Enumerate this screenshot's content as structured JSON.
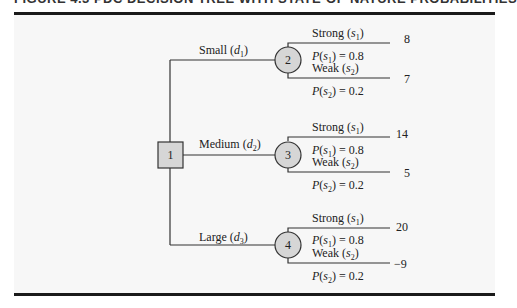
{
  "figure": {
    "caption": "FIGURE 4.3   PDC DECISION TREE WITH STATE-OF-NATURE PROBABILITIES"
  },
  "tree": {
    "decision_node": {
      "label": "1",
      "shape": "square"
    },
    "branches": [
      {
        "decision": "Small",
        "decision_symbol": "d",
        "decision_sub": "1",
        "chance_node": "2",
        "outcomes": [
          {
            "state": "Strong",
            "state_symbol": "s",
            "state_sub": "1",
            "prob_label": "P(s1) = 0.8",
            "prob_value": "0.8",
            "payoff": "8"
          },
          {
            "state": "Weak",
            "state_symbol": "s",
            "state_sub": "2",
            "prob_label": "P(s2) = 0.2",
            "prob_value": "0.2",
            "payoff": "7"
          }
        ]
      },
      {
        "decision": "Medium",
        "decision_symbol": "d",
        "decision_sub": "2",
        "chance_node": "3",
        "outcomes": [
          {
            "state": "Strong",
            "state_symbol": "s",
            "state_sub": "1",
            "prob_label": "P(s1) = 0.8",
            "prob_value": "0.8",
            "payoff": "14"
          },
          {
            "state": "Weak",
            "state_symbol": "s",
            "state_sub": "2",
            "prob_label": "P(s2) = 0.2",
            "prob_value": "0.2",
            "payoff": "5"
          }
        ]
      },
      {
        "decision": "Large",
        "decision_symbol": "d",
        "decision_sub": "3",
        "chance_node": "4",
        "outcomes": [
          {
            "state": "Strong",
            "state_symbol": "s",
            "state_sub": "1",
            "prob_label": "P(s1) = 0.8",
            "prob_value": "0.8",
            "payoff": "20"
          },
          {
            "state": "Weak",
            "state_symbol": "s",
            "state_sub": "2",
            "prob_label": "P(s2) = 0.2",
            "prob_value": "0.2",
            "payoff": "−9"
          }
        ]
      }
    ]
  },
  "colors": {
    "node_fill": "#d6d6d6",
    "line": "#333333",
    "rule": "#1a1a1a",
    "panel": "#f7f7f7"
  }
}
